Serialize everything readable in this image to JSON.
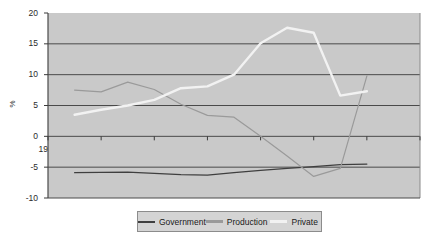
{
  "chart_data": {
    "type": "line",
    "title": "",
    "xlabel": "",
    "ylabel": "%",
    "xlim": [
      1994,
      2008
    ],
    "ylim": [
      -10,
      20
    ],
    "xticks": [
      "1994",
      "1996",
      "1998",
      "2000",
      "2002",
      "2004",
      "2006",
      "2008"
    ],
    "yticks": [
      "20",
      "15",
      "10",
      "5",
      "0",
      "-5",
      "-10"
    ],
    "grid": "horizontal",
    "legend_position": "bottom",
    "plot_background": "#c9c9c9",
    "series": [
      {
        "name": "Government",
        "color": "#3f3f3f",
        "x": [
          1995,
          1996,
          1997,
          1998,
          1999,
          2000,
          2001,
          2002,
          2003,
          2004,
          2005,
          2006
        ],
        "values": [
          -5.9,
          -5.85,
          -5.8,
          -6.0,
          -6.2,
          -6.3,
          -5.9,
          -5.5,
          -5.2,
          -4.9,
          -4.6,
          -4.5
        ]
      },
      {
        "name": "Production",
        "color": "#9a9a9a",
        "x": [
          1995,
          1996,
          1997,
          1998,
          1999,
          2000,
          2001,
          2002,
          2003,
          2004,
          2005,
          2006
        ],
        "values": [
          7.5,
          7.2,
          8.8,
          7.6,
          5.2,
          3.4,
          3.1,
          0.0,
          -3.2,
          -6.5,
          -5.2,
          9.8
        ]
      },
      {
        "name": "Private",
        "color": "#f2f2f2",
        "x": [
          1995,
          1996,
          1997,
          1998,
          1999,
          2000,
          2001,
          2002,
          2003,
          2004,
          2005,
          2006
        ],
        "values": [
          3.5,
          4.3,
          5.0,
          5.9,
          7.8,
          8.1,
          10.0,
          15.1,
          17.6,
          16.8,
          6.6,
          7.3
        ]
      }
    ]
  },
  "legend": {
    "items": [
      {
        "label": "Government"
      },
      {
        "label": "Production"
      },
      {
        "label": "Private"
      }
    ]
  }
}
